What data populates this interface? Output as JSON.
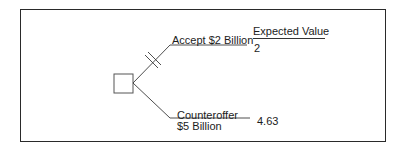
{
  "diagram": {
    "type": "decision-tree",
    "header": {
      "expected_value_label": "Expected Value"
    },
    "decision_node": {
      "shape": "square"
    },
    "branches": [
      {
        "label": "Accept $2 Billion",
        "label_lines": [
          "Accept $2 Billion"
        ],
        "expected_value": "2",
        "pruned": true
      },
      {
        "label": "Counteroffer $5 Billion",
        "label_lines": [
          "Counteroffer",
          "$5 Billion"
        ],
        "expected_value": "4.63",
        "pruned": false
      }
    ],
    "colors": {
      "line": "#3a3a3a",
      "text": "#1c1c1c",
      "frame": "#2a2a2a",
      "background": "#ffffff"
    }
  }
}
